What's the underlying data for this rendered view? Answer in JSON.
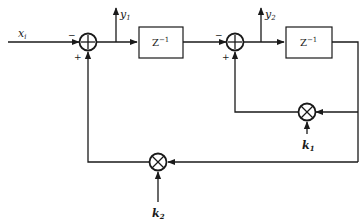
{
  "diagram": {
    "type": "block-diagram",
    "input": {
      "label": "x",
      "subscript": "i"
    },
    "outputs": [
      {
        "id": "y1",
        "label": "y",
        "subscript": "1"
      },
      {
        "id": "y2",
        "label": "y",
        "subscript": "2"
      }
    ],
    "adders": [
      {
        "id": "adder1",
        "symbol": "+",
        "input_signs": {
          "left": "−",
          "bottom": "+"
        }
      },
      {
        "id": "adder2",
        "symbol": "+",
        "input_signs": {
          "left": "−",
          "bottom": "+"
        }
      }
    ],
    "delays": [
      {
        "id": "delay1",
        "label": "Z",
        "exponent": "−1"
      },
      {
        "id": "delay2",
        "label": "Z",
        "exponent": "−1"
      }
    ],
    "multipliers": [
      {
        "id": "mult1",
        "symbol": "×",
        "gain": {
          "label": "k",
          "subscript": "1"
        }
      },
      {
        "id": "mult2",
        "symbol": "×",
        "gain": {
          "label": "k",
          "subscript": "2"
        }
      }
    ],
    "connections": [
      "x_i -> adder1 (−)",
      "adder1 -> y1",
      "adder1 -> delay1",
      "delay1 -> adder2 (−)",
      "adder2 -> y2",
      "adder2 -> delay2",
      "delay2 -> mult1",
      "k1 -> mult1",
      "mult1 -> adder2 (+)",
      "delay2 -> mult2",
      "k2 -> mult2",
      "mult2 -> adder1 (+)"
    ]
  }
}
